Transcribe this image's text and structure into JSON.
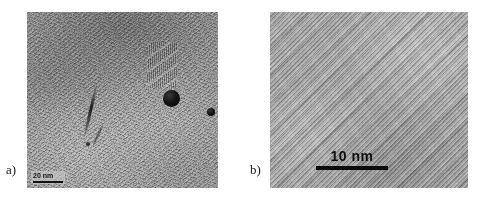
{
  "figure": {
    "kind": "tem-micrograph-figure",
    "background_color": "#ffffff",
    "panel_count": 2
  },
  "panels": [
    {
      "id": "a",
      "label": "a)",
      "content_description": "Low-magnification TEM image of a tangled carbon nanotube / nanofiber network with dark metal catalyst nanoparticles",
      "base_color": "#9c9c9c",
      "scalebar": {
        "label": "20 nm",
        "bar_color": "#121212",
        "text_color": "#161616",
        "position": "bottom-left-inset"
      },
      "features": [
        {
          "name": "nanoparticle-large",
          "shape": "dark-round",
          "color": "#141414"
        },
        {
          "name": "nanoparticle-small",
          "shape": "dark-round",
          "color": "#141414"
        },
        {
          "name": "nanoparticle-tiny",
          "shape": "dark-round",
          "color": "#141414"
        },
        {
          "name": "nanotube-bundle-streak",
          "shape": "dark-line",
          "color": "#181818"
        },
        {
          "name": "lattice-fringe-patch",
          "shape": "striped-region",
          "color": "#2a2a2a"
        }
      ]
    },
    {
      "id": "b",
      "label": "b)",
      "content_description": "High-resolution TEM image showing parallel diagonal lattice fringes of multiwalled nanotube walls",
      "base_color": "#adadad",
      "scalebar": {
        "label": "10 nm",
        "bar_color": "#0b0b0b",
        "text_color": "#0e0e0e",
        "position": "bottom-center"
      },
      "features": [
        {
          "name": "lattice-fringes",
          "shape": "diagonal-stripes",
          "color": "#3a3a3a"
        }
      ]
    }
  ]
}
